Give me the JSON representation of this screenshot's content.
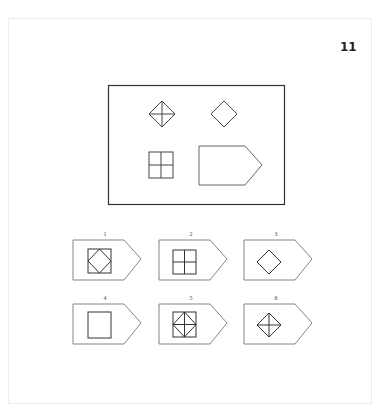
{
  "question": {
    "number": "11",
    "prompt_grid": {
      "cells": [
        {
          "position": "top-left",
          "figure": "diamond-with-cross"
        },
        {
          "position": "top-right",
          "figure": "diamond"
        },
        {
          "position": "bottom-left",
          "figure": "square-with-cross"
        },
        {
          "position": "bottom-right",
          "figure": "empty-pentagon-answer-slot"
        }
      ]
    },
    "options": [
      {
        "label": "1",
        "figure": "square-with-inscribed-diamond"
      },
      {
        "label": "2",
        "figure": "square-with-cross"
      },
      {
        "label": "3",
        "figure": "diamond"
      },
      {
        "label": "4",
        "figure": "square"
      },
      {
        "label": "5",
        "figure": "square-with-inscribed-diamond-and-cross"
      },
      {
        "label": "6",
        "figure": "diamond-with-cross"
      }
    ]
  },
  "colors": {
    "stroke": "#333333",
    "light_stroke": "#888888",
    "page_border": "#ececec"
  }
}
